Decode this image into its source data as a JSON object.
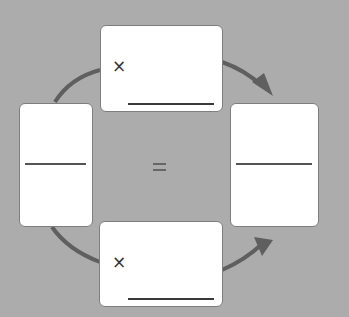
{
  "diagram": {
    "type": "equivalent-fractions-multiplication-cycle",
    "colors": {
      "background": "#acacac",
      "box_fill": "#ffffff",
      "box_border": "#7e7e7e",
      "arrow": "#5f5f5f",
      "line": "#3a3a3a"
    },
    "top_multiplier": {
      "operator": "×",
      "value": ""
    },
    "bottom_multiplier": {
      "operator": "×",
      "value": ""
    },
    "left_fraction": {
      "numerator": "",
      "denominator": ""
    },
    "right_fraction": {
      "numerator": "",
      "denominator": ""
    },
    "relation": "="
  }
}
